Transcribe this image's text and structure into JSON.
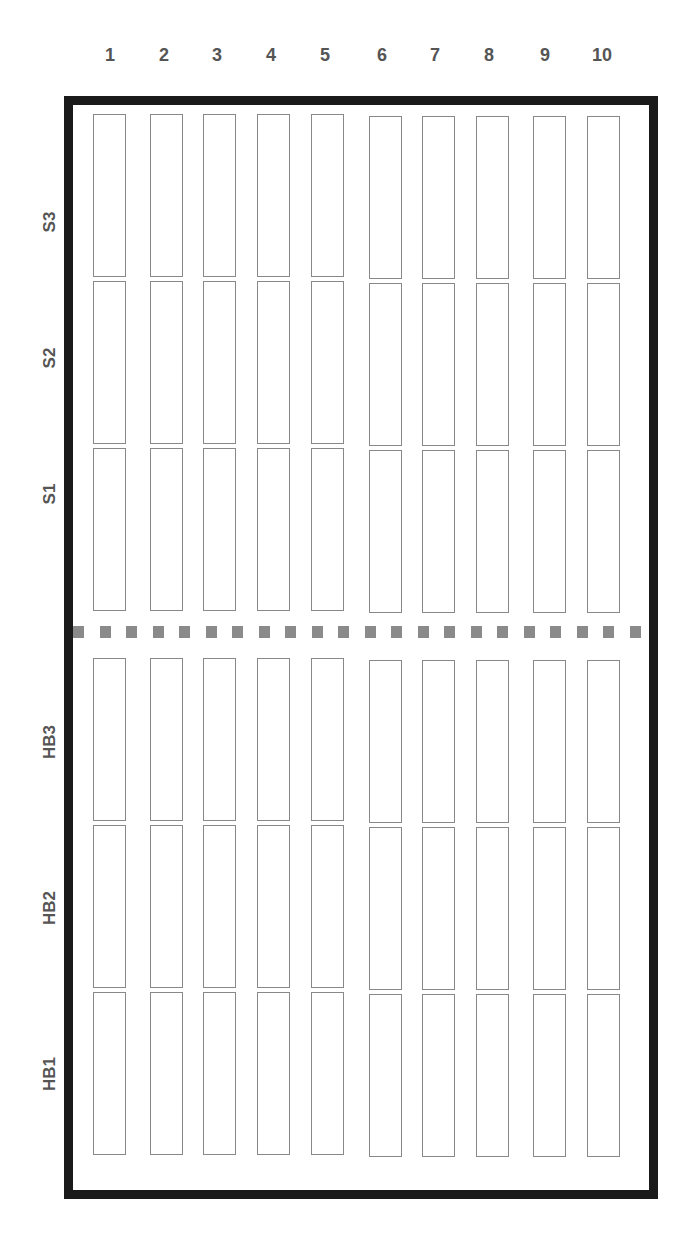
{
  "columns": [
    "1",
    "2",
    "3",
    "4",
    "5",
    "6",
    "7",
    "8",
    "9",
    "10"
  ],
  "upper_rows": [
    "S3",
    "S2",
    "S1"
  ],
  "lower_rows": [
    "HB3",
    "HB2",
    "HB1"
  ],
  "colors": {
    "frame": "#1a1a1a",
    "bed_outline": "#888888",
    "divider": "#8a8a8a",
    "label": "#555555"
  }
}
